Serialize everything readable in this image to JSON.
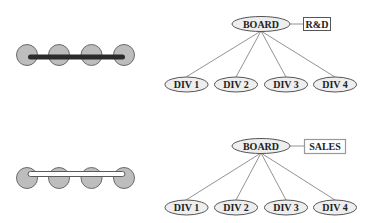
{
  "colors": {
    "background": "#ffffff",
    "circle_fill": "#bdbdbd",
    "circle_stroke": "#6a6a6a",
    "bar_solid": "#2b2b2b",
    "bar_hollow_fill": "#ffffff",
    "bar_hollow_stroke": "#5a5a5a",
    "ellipse_fill": "#eeeeee",
    "ellipse_stroke": "#555555",
    "line": "#777777",
    "box_dark_stroke": "#555555",
    "box_light_stroke": "#999999",
    "text": "#222222"
  },
  "icons": [
    {
      "name": "beads-on-solid-bar-icon",
      "bead_count": 4,
      "bar_style": "solid"
    },
    {
      "name": "beads-on-hollow-bar-icon",
      "bead_count": 4,
      "bar_style": "hollow"
    }
  ],
  "trees": [
    {
      "name": "rnd-org-chart",
      "root": {
        "label": "BOARD"
      },
      "attached_box": {
        "label": "R&D",
        "style": "dark"
      },
      "children": [
        {
          "label": "DIV 1"
        },
        {
          "label": "DIV 2"
        },
        {
          "label": "DIV 3"
        },
        {
          "label": "DIV 4"
        }
      ]
    },
    {
      "name": "sales-org-chart",
      "root": {
        "label": "BOARD"
      },
      "attached_box": {
        "label": "SALES",
        "style": "light"
      },
      "children": [
        {
          "label": "DIV 1"
        },
        {
          "label": "DIV 2"
        },
        {
          "label": "DIV 3"
        },
        {
          "label": "DIV 4"
        }
      ]
    }
  ]
}
